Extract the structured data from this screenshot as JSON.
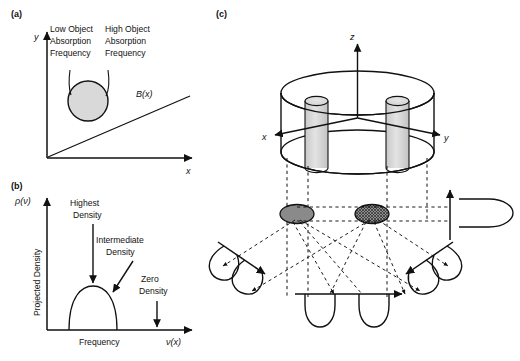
{
  "figure": {
    "background_color": "#ffffff",
    "line_color": "#111111",
    "object_fill": "#d4d4d4",
    "ellipse_fill": "#8c8c8c"
  },
  "panel_a": {
    "label": "(a)",
    "y_axis_label": "y",
    "x_axis_label": "x",
    "gradient_label": "B(x)",
    "annotation_left": [
      "Low Object",
      "Absorption",
      "Frequency"
    ],
    "annotation_right": [
      "High Object",
      "Absorption",
      "Frequency"
    ],
    "object_shape": "circle",
    "object_fill": "#d9d9d9"
  },
  "panel_b": {
    "label": "(b)",
    "y_axis_symbol": "ρ(ν)",
    "y_axis_label": "Projected Density",
    "x_axis_label": "Frequency",
    "x_axis_symbol": "ν(x)",
    "annotations": [
      {
        "name": "highest-density",
        "lines": [
          "Highest",
          "Density"
        ]
      },
      {
        "name": "intermediate-density",
        "lines": [
          "Intermediate",
          "Density"
        ]
      },
      {
        "name": "zero-density",
        "lines": [
          "Zero",
          "Density"
        ]
      }
    ],
    "curve_shape": "semicircular dome"
  },
  "panel_c": {
    "label": "(c)",
    "axis_labels": {
      "z": "z",
      "x": "x",
      "y": "y"
    },
    "outer_object": "cylinder",
    "inner_objects": 2,
    "inner_object_shape": "cylinder",
    "projections": [
      {
        "name": "projection-left-diagonal",
        "lobes": 2
      },
      {
        "name": "projection-bottom-center",
        "lobes": 2
      },
      {
        "name": "projection-right-diagonal",
        "lobes": 2
      },
      {
        "name": "projection-right-vertical",
        "lobes": 1
      }
    ],
    "cross_sections": [
      {
        "name": "cross-section-left",
        "fill": "#7f7f7f"
      },
      {
        "name": "cross-section-right",
        "fill": "#7f7f7f",
        "pattern": "crosshatch"
      }
    ]
  }
}
